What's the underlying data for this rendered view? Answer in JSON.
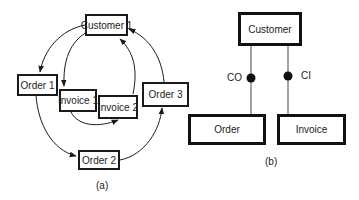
{
  "diagram_a": {
    "caption": "(a)",
    "nodes": {
      "customer1": "Customer 1",
      "order1": "Order 1",
      "invoice1": "Invoice 1",
      "invoice2": "Invoice 2",
      "order2": "Order 2",
      "order3": "Order 3"
    },
    "edges": [
      {
        "from": "Customer 1",
        "to": "Order 1"
      },
      {
        "from": "Customer 1",
        "to": "Invoice 1"
      },
      {
        "from": "Invoice 1",
        "to": "Invoice 2"
      },
      {
        "from": "Invoice 2",
        "to": "Customer 1"
      },
      {
        "from": "Order 1",
        "to": "Order 2"
      },
      {
        "from": "Order 2",
        "to": "Order 3"
      },
      {
        "from": "Order 3",
        "to": "Customer 1"
      }
    ]
  },
  "diagram_b": {
    "caption": "(b)",
    "nodes": {
      "customer": "Customer",
      "order": "Order",
      "invoice": "Invoice"
    },
    "relations": {
      "co": "CO",
      "ci": "CI"
    }
  },
  "colors": {
    "line": "#1a1a1a",
    "background": "#ffffff"
  }
}
